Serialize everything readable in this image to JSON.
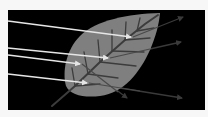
{
  "diagram": {
    "colors": {
      "page_background": "#f7f7f7",
      "panel_background": "#000000",
      "leaf_fill": "#7f7f7f",
      "leaf_vein": "#3c3c3c",
      "incident_ray": "#e6e6e6",
      "transmitted_ray": "#3a3a3a"
    },
    "panel": {
      "x": 8,
      "y": 10,
      "width": 197,
      "height": 100
    },
    "incident_rays": [
      {
        "from": [
          8,
          21
        ],
        "to": [
          133,
          37
        ]
      },
      {
        "from": [
          8,
          48
        ],
        "to": [
          110,
          58
        ]
      },
      {
        "from": [
          8,
          55
        ],
        "to": [
          82,
          64
        ]
      },
      {
        "from": [
          8,
          74
        ],
        "to": [
          89,
          83
        ]
      }
    ],
    "transmitted_rays": [
      {
        "from": [
          133,
          37
        ],
        "to": [
          183,
          17
        ]
      },
      {
        "from": [
          110,
          58
        ],
        "to": [
          181,
          42
        ]
      },
      {
        "from": [
          82,
          64
        ],
        "to": [
          127,
          98
        ]
      },
      {
        "from": [
          89,
          83
        ],
        "to": [
          182,
          98
        ]
      }
    ]
  }
}
